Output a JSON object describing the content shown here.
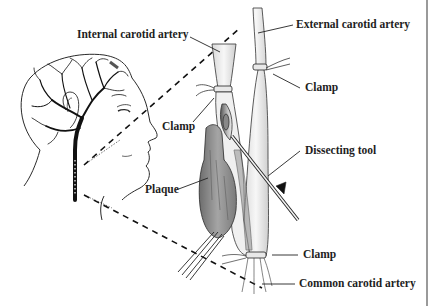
{
  "diagram": {
    "labels": {
      "internal_carotid": "Internal carotid artery",
      "external_carotid": "External carotid artery",
      "clamp_upper_right": "Clamp",
      "clamp_left": "Clamp",
      "dissecting_tool": "Dissecting tool",
      "plaque": "Plaque",
      "clamp_lower": "Clamp",
      "common_carotid": "Common carotid artery"
    },
    "colors": {
      "ink": "#1e1e1e",
      "plaque": "#8a8a8a",
      "artery_fill": "#f4f4f4",
      "frame": "#9a9a9a",
      "background": "#ffffff"
    }
  }
}
